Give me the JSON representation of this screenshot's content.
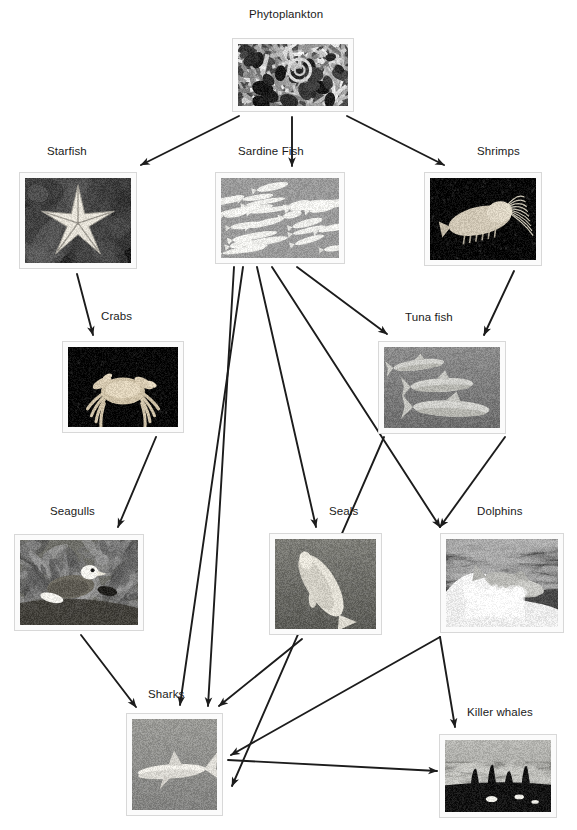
{
  "diagram": {
    "background": "#ffffff",
    "arrow_color": "#1c1c1c",
    "label_color": "#1a1a1a",
    "frame_color": "#d8d8d8"
  },
  "nodes": [
    {
      "id": "phytoplankton",
      "label": "Phytoplankton",
      "label_x": 249,
      "label_y": 8,
      "box_x": 232,
      "box_y": 38,
      "box_w": 122,
      "box_h": 74,
      "photo": "phytoplankton-photo",
      "tone": "dark-speckle"
    },
    {
      "id": "starfish",
      "label": "Starfish",
      "label_x": 47,
      "label_y": 145,
      "box_x": 19,
      "box_y": 172,
      "box_w": 118,
      "box_h": 97,
      "photo": "starfish-photo",
      "tone": "dark-star"
    },
    {
      "id": "sardine-fish",
      "label": "Sardine Fish",
      "label_x": 238,
      "label_y": 145,
      "box_x": 215,
      "box_y": 172,
      "box_w": 130,
      "box_h": 92,
      "photo": "sardine-fish-photo",
      "tone": "grey-school"
    },
    {
      "id": "shrimps",
      "label": "Shrimps",
      "label_x": 477,
      "label_y": 145,
      "box_x": 424,
      "box_y": 172,
      "box_w": 118,
      "box_h": 94,
      "photo": "shrimp-photo",
      "tone": "black-shrimp"
    },
    {
      "id": "crabs",
      "label": "Crabs",
      "label_x": 101,
      "label_y": 310,
      "box_x": 62,
      "box_y": 341,
      "box_w": 122,
      "box_h": 92,
      "photo": "crab-photo",
      "tone": "black-crab"
    },
    {
      "id": "tuna-fish",
      "label": "Tuna fish",
      "label_x": 405,
      "label_y": 311,
      "box_x": 378,
      "box_y": 341,
      "box_w": 128,
      "box_h": 93,
      "photo": "tuna-fish-photo",
      "tone": "grey-tuna"
    },
    {
      "id": "seagulls",
      "label": "Seagulls",
      "label_x": 50,
      "label_y": 505,
      "box_x": 14,
      "box_y": 534,
      "box_w": 130,
      "box_h": 97,
      "photo": "seagull-photo",
      "tone": "shore-gull"
    },
    {
      "id": "seals",
      "label": "Seals",
      "label_x": 329,
      "label_y": 505,
      "box_x": 269,
      "box_y": 533,
      "box_w": 113,
      "box_h": 102,
      "photo": "seal-photo",
      "tone": "underwater-seal"
    },
    {
      "id": "dolphins",
      "label": "Dolphins",
      "label_x": 477,
      "label_y": 505,
      "box_x": 440,
      "box_y": 533,
      "box_w": 124,
      "box_h": 100,
      "photo": "dolphin-photo",
      "tone": "surf-dolphin"
    },
    {
      "id": "sharks",
      "label": "Sharks",
      "label_x": 148,
      "label_y": 688,
      "box_x": 126,
      "box_y": 713,
      "box_w": 97,
      "box_h": 103,
      "photo": "shark-photo",
      "tone": "open-water-shark"
    },
    {
      "id": "killer-whales",
      "label": "Killer whales",
      "label_x": 467,
      "label_y": 706,
      "box_x": 439,
      "box_y": 734,
      "box_w": 118,
      "box_h": 84,
      "photo": "killer-whale-photo",
      "tone": "orca-pod"
    }
  ],
  "edges": [
    {
      "id": "phytoplankton-to-starfish",
      "from": "Phytoplankton",
      "to": "Starfish",
      "x1": 239,
      "y1": 116,
      "x2": 141,
      "y2": 165
    },
    {
      "id": "phytoplankton-to-sardine",
      "from": "Phytoplankton",
      "to": "Sardine Fish",
      "x1": 292,
      "y1": 117,
      "x2": 292,
      "y2": 166
    },
    {
      "id": "phytoplankton-to-shrimps",
      "from": "Phytoplankton",
      "to": "Shrimps",
      "x1": 347,
      "y1": 116,
      "x2": 444,
      "y2": 165
    },
    {
      "id": "starfish-to-crabs",
      "from": "Starfish",
      "to": "Crabs",
      "x1": 77,
      "y1": 274,
      "x2": 93,
      "y2": 335
    },
    {
      "id": "shrimps-to-tuna",
      "from": "Shrimps",
      "to": "Tuna fish",
      "x1": 514,
      "y1": 271,
      "x2": 484,
      "y2": 335
    },
    {
      "id": "sardine-to-tuna",
      "from": "Sardine Fish",
      "to": "Tuna fish",
      "x1": 297,
      "y1": 267,
      "x2": 387,
      "y2": 334
    },
    {
      "id": "sardine-to-seals",
      "from": "Sardine Fish",
      "to": "Seals",
      "x1": 257,
      "y1": 267,
      "x2": 316,
      "y2": 527
    },
    {
      "id": "sardine-to-sharks-a",
      "from": "Sardine Fish",
      "to": "Sharks",
      "x1": 234,
      "y1": 267,
      "x2": 208,
      "y2": 706
    },
    {
      "id": "sardine-to-sharks-b",
      "from": "Sardine Fish",
      "to": "Sharks",
      "x1": 243,
      "y1": 267,
      "x2": 180,
      "y2": 705
    },
    {
      "id": "sardine-to-dolphins",
      "from": "Sardine Fish",
      "to": "Dolphins",
      "x1": 272,
      "y1": 267,
      "x2": 440,
      "y2": 527
    },
    {
      "id": "tuna-to-dolphins",
      "from": "Tuna fish",
      "to": "Dolphins",
      "x1": 505,
      "y1": 437,
      "x2": 440,
      "y2": 527
    },
    {
      "id": "tuna-to-sharks",
      "from": "Tuna fish",
      "to": "Sharks",
      "x1": 384,
      "y1": 437,
      "x2": 232,
      "y2": 786
    },
    {
      "id": "crabs-to-seagulls",
      "from": "Crabs",
      "to": "Seagulls",
      "x1": 156,
      "y1": 437,
      "x2": 118,
      "y2": 527
    },
    {
      "id": "seagulls-to-sharks",
      "from": "Seagulls",
      "to": "Sharks",
      "x1": 81,
      "y1": 635,
      "x2": 136,
      "y2": 707
    },
    {
      "id": "seals-to-sharks",
      "from": "Seals",
      "to": "Sharks",
      "x1": 302,
      "y1": 639,
      "x2": 219,
      "y2": 706
    },
    {
      "id": "dolphins-to-killer-whales",
      "from": "Dolphins",
      "to": "Killer whales",
      "x1": 440,
      "y1": 637,
      "x2": 455,
      "y2": 727
    },
    {
      "id": "sharks-to-killer-whales",
      "from": "Sharks",
      "to": "Killer whales",
      "x1": 228,
      "y1": 760,
      "x2": 437,
      "y2": 771
    },
    {
      "id": "dolphins-to-sharks",
      "from": "Dolphins",
      "to": "Sharks",
      "x1": 440,
      "y1": 637,
      "x2": 231,
      "y2": 755
    }
  ]
}
